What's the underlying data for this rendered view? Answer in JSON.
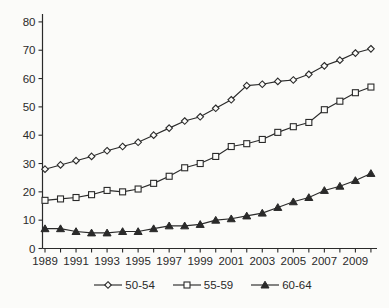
{
  "page": {
    "background": "#fbfbf9",
    "width": 389,
    "height": 308
  },
  "chart_data": {
    "type": "line",
    "title": "",
    "xlabel": "",
    "ylabel": "",
    "x": [
      1989,
      1990,
      1991,
      1992,
      1993,
      1994,
      1995,
      1996,
      1997,
      1998,
      1999,
      2000,
      2001,
      2002,
      2003,
      2004,
      2005,
      2006,
      2007,
      2008,
      2009,
      2010
    ],
    "x_tick_labels": [
      "1989",
      "1991",
      "1993",
      "1995",
      "1997",
      "1999",
      "2001",
      "2003",
      "2005",
      "2007",
      "2009"
    ],
    "x_label_every": 2,
    "ylim": [
      0,
      80
    ],
    "y_tick_step": 10,
    "y_ticks": [
      0,
      10,
      20,
      30,
      40,
      50,
      60,
      70,
      80
    ],
    "grid": false,
    "legend_position": "bottom",
    "line_color": "#2a2a2a",
    "text_color": "#2a2a2a",
    "marker_open_fill": "#fcfcfa",
    "series": [
      {
        "name": "50-54",
        "marker": "diamond-open",
        "values": [
          28,
          29.5,
          31,
          32.5,
          34.5,
          36,
          37.5,
          40,
          42.5,
          45,
          46.5,
          49.5,
          52.5,
          57.5,
          58,
          59,
          59.5,
          61.5,
          64.5,
          66.5,
          69,
          70.5
        ]
      },
      {
        "name": "55-59",
        "marker": "square-open",
        "values": [
          17,
          17.5,
          18,
          19,
          20.5,
          20,
          21,
          23,
          25.5,
          28.5,
          30,
          32.5,
          36,
          37,
          38.5,
          41,
          43,
          44.5,
          49,
          52,
          55,
          57
        ]
      },
      {
        "name": "60-64",
        "marker": "triangle-filled",
        "values": [
          7,
          7,
          6,
          5.5,
          5.5,
          6,
          6,
          7,
          8,
          8,
          8.5,
          10,
          10.5,
          11.5,
          12.5,
          14.5,
          16.5,
          18,
          20.5,
          22,
          24,
          26.5
        ]
      }
    ]
  }
}
